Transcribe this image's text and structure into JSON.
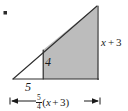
{
  "figure": {
    "type": "geometry-diagram",
    "colors": {
      "shaded_fill": "#bcbcbc",
      "outline": "#1a1a1a",
      "background": "#ffffff",
      "text": "#1a1a1a"
    },
    "labels": {
      "inner_height": "4",
      "base_left": "5",
      "right_side": "x + 3",
      "right_side_variable": "x",
      "right_side_operator": "+",
      "right_side_constant": "3"
    },
    "dimension": {
      "coefficient_numerator": "5",
      "coefficient_denominator": "4",
      "expression": "(x + 3)",
      "full_text": "5/4 (x + 3)",
      "arrow_style": "double-headed-with-end-ticks"
    },
    "geometry": {
      "apex": [
        97,
        6
      ],
      "bottom_left": [
        13,
        79
      ],
      "bottom_right": [
        98,
        79
      ],
      "divider_x": 43,
      "divider_top_y": 50,
      "divider_bottom_y": 79,
      "dimension_line_y": 101,
      "dimension_left_x": 10,
      "dimension_right_x": 100
    },
    "marks": {
      "corner_dot": "bullet-artifact"
    }
  }
}
